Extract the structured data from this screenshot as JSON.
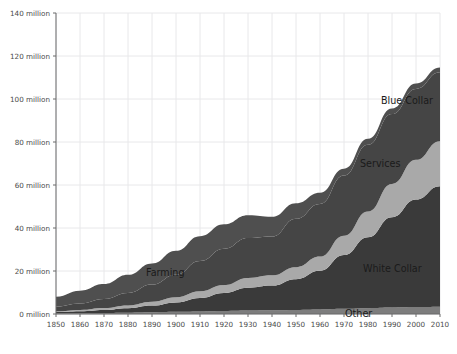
{
  "chart_data": {
    "type": "area",
    "stacked": true,
    "title": "",
    "subtitle": "",
    "xlabel": "",
    "ylabel": "",
    "grid": true,
    "legend_position": "inline-annotations",
    "xlim": [
      1850,
      2010
    ],
    "ylim": [
      0,
      140000000
    ],
    "ytick_values": [
      0,
      20000000,
      40000000,
      60000000,
      80000000,
      100000000,
      120000000,
      140000000
    ],
    "ytick_labels": [
      "0 million",
      "20 million",
      "40 million",
      "60 million",
      "80 million",
      "100 million",
      "120 million",
      "140 million"
    ],
    "xtick_values": [
      1850,
      1860,
      1870,
      1880,
      1890,
      1900,
      1910,
      1920,
      1930,
      1940,
      1950,
      1960,
      1970,
      1980,
      1990,
      2000,
      2010
    ],
    "xtick_labels": [
      "1850",
      "1860",
      "1870",
      "1880",
      "1890",
      "1900",
      "1910",
      "1920",
      "1930",
      "1940",
      "1950",
      "1960",
      "1970",
      "1980",
      "1990",
      "2000",
      "2010"
    ],
    "x": [
      1850,
      1860,
      1870,
      1880,
      1890,
      1900,
      1910,
      1920,
      1930,
      1940,
      1950,
      1960,
      1970,
      1980,
      1990,
      2000,
      2010
    ],
    "units": "millions of workers",
    "stack_order_bottom_to_top": [
      "Other",
      "White Collar",
      "Services",
      "Blue Collar",
      "Farming"
    ],
    "series": [
      {
        "name": "Other",
        "color": "#7d7d7d",
        "values": [
          0.3,
          0.4,
          0.5,
          0.6,
          0.8,
          1.0,
          1.2,
          1.4,
          1.6,
          1.7,
          1.9,
          2.1,
          2.4,
          2.7,
          3.0,
          3.2,
          3.4
        ]
      },
      {
        "name": "White Collar",
        "color": "#3a3a3a",
        "values": [
          0.6,
          0.9,
          1.4,
          2.1,
          3.1,
          4.4,
          6.3,
          8.4,
          10.6,
          11.5,
          14.3,
          18.0,
          25.0,
          33.0,
          42.0,
          50.0,
          56.0
        ]
      },
      {
        "name": "Services",
        "color": "#a9a9a9",
        "values": [
          0.4,
          0.6,
          0.9,
          1.3,
          1.8,
          2.4,
          3.1,
          3.7,
          4.6,
          4.8,
          5.6,
          6.6,
          9.0,
          12.0,
          15.5,
          18.5,
          21.0
        ]
      },
      {
        "name": "Blue Collar",
        "color": "#454545",
        "values": [
          2.2,
          3.0,
          4.2,
          5.8,
          8.0,
          10.5,
          14.0,
          16.8,
          18.5,
          18.0,
          22.5,
          24.5,
          28.0,
          31.0,
          32.5,
          33.0,
          32.0
        ]
      },
      {
        "name": "Farming",
        "color": "#4f4f4f",
        "values": [
          4.5,
          5.9,
          6.9,
          8.4,
          9.8,
          11.1,
          11.6,
          11.4,
          10.6,
          9.2,
          7.2,
          5.2,
          3.2,
          2.8,
          2.6,
          2.5,
          2.2
        ]
      }
    ],
    "totals": [
      8.0,
      10.8,
      13.9,
      18.2,
      23.5,
      29.4,
      36.2,
      41.7,
      45.9,
      45.2,
      51.5,
      56.4,
      67.6,
      81.5,
      95.6,
      107.2,
      114.6
    ],
    "annotations": [
      {
        "label": "Blue Collar",
        "x_px": 381,
        "y_px": 104,
        "series": "Blue Collar"
      },
      {
        "label": "Services",
        "x_px": 360,
        "y_px": 167,
        "series": "Services"
      },
      {
        "label": "Farming",
        "x_px": 146,
        "y_px": 276,
        "series": "Farming"
      },
      {
        "label": "White Collar",
        "x_px": 363,
        "y_px": 272,
        "series": "White Collar"
      },
      {
        "label": "Other",
        "x_px": 345,
        "y_px": 317,
        "series": "Other"
      }
    ],
    "colors": {
      "background": "#ffffff",
      "grid": "#e8e8ea",
      "axis": "#6b6b6b",
      "tick_text": "#4a4a4a",
      "label_text": "#1a1a1a"
    }
  }
}
